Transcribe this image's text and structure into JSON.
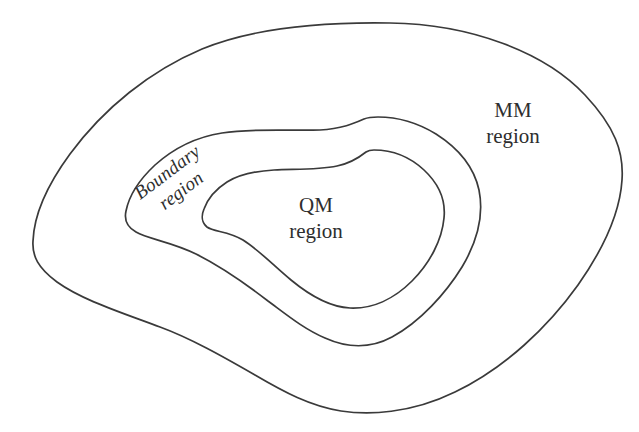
{
  "figure": {
    "type": "nested-region-diagram",
    "background_color": "#ffffff",
    "stroke_color": "#3a3a3a",
    "text_color": "#2e2e2e"
  },
  "labels": {
    "mm": {
      "line1": "MM",
      "line2": "region"
    },
    "qm": {
      "line1": "QM",
      "line2": "region"
    },
    "boundary": {
      "line1": "Boundary",
      "line2": "region"
    }
  },
  "regions": [
    {
      "id": "mm-region",
      "name": "MM region",
      "nesting_level": 0,
      "description": "outermost closed irregular contour"
    },
    {
      "id": "boundary-region",
      "name": "Boundary region",
      "nesting_level": 1,
      "description": "middle closed irregular contour"
    },
    {
      "id": "qm-region",
      "name": "QM region",
      "nesting_level": 2,
      "description": "innermost closed irregular contour"
    }
  ]
}
